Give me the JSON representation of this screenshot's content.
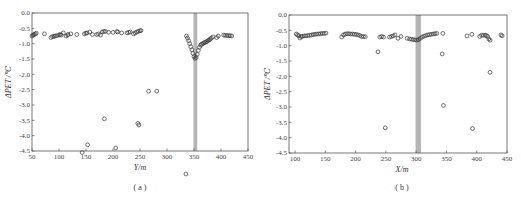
{
  "chart_data": [
    {
      "type": "scatter",
      "panel": "a",
      "caption": "( a )",
      "xlabel": "Y/m",
      "ylabel": "ΔPET /℃",
      "xlim": [
        50,
        450
      ],
      "ylim": [
        -4.5,
        0.0
      ],
      "xticks": [
        50,
        100,
        150,
        200,
        250,
        300,
        350,
        400,
        450
      ],
      "yticks": [
        0.0,
        -0.5,
        -1.0,
        -1.5,
        -2.0,
        -2.5,
        -3.0,
        -3.5,
        -4.0,
        -4.5
      ],
      "highlight_band": [
        349,
        356
      ],
      "grid": false,
      "marker": "open-circle",
      "series": [
        {
          "name": "ΔPET",
          "points": [
            [
              50,
              -0.75
            ],
            [
              52,
              -0.72
            ],
            [
              54,
              -0.7
            ],
            [
              56,
              -0.68
            ],
            [
              58,
              -0.66
            ],
            [
              73,
              -0.68
            ],
            [
              85,
              -0.8
            ],
            [
              88,
              -0.77
            ],
            [
              91,
              -0.76
            ],
            [
              93,
              -0.75
            ],
            [
              96,
              -0.74
            ],
            [
              100,
              -0.72
            ],
            [
              102,
              -0.7
            ],
            [
              104,
              -0.72
            ],
            [
              108,
              -0.65
            ],
            [
              113,
              -0.75
            ],
            [
              116,
              -0.72
            ],
            [
              117,
              -0.7
            ],
            [
              122,
              -0.68
            ],
            [
              133,
              -0.7
            ],
            [
              147,
              -0.68
            ],
            [
              150,
              -0.66
            ],
            [
              152,
              -0.65
            ],
            [
              157,
              -0.62
            ],
            [
              162,
              -0.7
            ],
            [
              170,
              -0.7
            ],
            [
              173,
              -0.68
            ],
            [
              177,
              -0.72
            ],
            [
              180,
              -0.62
            ],
            [
              183,
              -0.6
            ],
            [
              186,
              -0.6
            ],
            [
              192,
              -0.63
            ],
            [
              200,
              -0.63
            ],
            [
              207,
              -0.6
            ],
            [
              209,
              -0.62
            ],
            [
              216,
              -0.65
            ],
            [
              226,
              -0.65
            ],
            [
              229,
              -0.63
            ],
            [
              232,
              -0.62
            ],
            [
              238,
              -0.68
            ],
            [
              241,
              -0.65
            ],
            [
              244,
              -0.62
            ],
            [
              247,
              -0.6
            ],
            [
              250,
              -0.58
            ],
            [
              252,
              -0.57
            ],
            [
              336,
              -0.75
            ],
            [
              338,
              -0.82
            ],
            [
              340,
              -0.9
            ],
            [
              342,
              -1.0
            ],
            [
              344,
              -1.1
            ],
            [
              346,
              -1.2
            ],
            [
              348,
              -1.32
            ],
            [
              350,
              -1.42
            ],
            [
              352,
              -1.48
            ],
            [
              354,
              -1.45
            ],
            [
              356,
              -1.35
            ],
            [
              358,
              -1.22
            ],
            [
              360,
              -1.12
            ],
            [
              362,
              -1.05
            ],
            [
              364,
              -1.02
            ],
            [
              366,
              -1.0
            ],
            [
              368,
              -0.98
            ],
            [
              370,
              -0.96
            ],
            [
              372,
              -0.95
            ],
            [
              374,
              -0.93
            ],
            [
              376,
              -0.9
            ],
            [
              378,
              -0.88
            ],
            [
              380,
              -0.85
            ],
            [
              382,
              -0.82
            ],
            [
              385,
              -0.78
            ],
            [
              392,
              -0.8
            ],
            [
              395,
              -0.75
            ],
            [
              405,
              -0.72
            ],
            [
              408,
              -0.73
            ],
            [
              411,
              -0.73
            ],
            [
              414,
              -0.74
            ],
            [
              417,
              -0.74
            ],
            [
              420,
              -0.75
            ],
            [
              266,
              -2.55
            ],
            [
              281,
              -2.55
            ],
            [
              184,
              -3.45
            ],
            [
              246,
              -3.6
            ],
            [
              248,
              -3.65
            ],
            [
              153,
              -4.3
            ],
            [
              205,
              -4.4
            ],
            [
              143,
              -4.55
            ],
            [
              335,
              -5.25
            ]
          ]
        }
      ]
    },
    {
      "type": "scatter",
      "panel": "b",
      "caption": "( b )",
      "xlabel": "X/m",
      "ylabel": "ΔPET /℃",
      "xlim": [
        90,
        450
      ],
      "ylim": [
        -4.5,
        0.0
      ],
      "xticks": [
        100,
        150,
        200,
        250,
        300,
        350,
        400,
        450
      ],
      "yticks": [
        0.0,
        -0.5,
        -1.0,
        -1.5,
        -2.0,
        -2.5,
        -3.0,
        -3.5,
        -4.0,
        -4.5
      ],
      "highlight_band": [
        299,
        308
      ],
      "grid": false,
      "marker": "open-circle",
      "series": [
        {
          "name": "ΔPET",
          "points": [
            [
              102,
              -0.62
            ],
            [
              104,
              -0.65
            ],
            [
              106,
              -0.68
            ],
            [
              108,
              -0.75
            ],
            [
              110,
              -0.7
            ],
            [
              112,
              -0.7
            ],
            [
              115,
              -0.68
            ],
            [
              118,
              -0.68
            ],
            [
              121,
              -0.67
            ],
            [
              124,
              -0.66
            ],
            [
              127,
              -0.65
            ],
            [
              130,
              -0.64
            ],
            [
              133,
              -0.63
            ],
            [
              136,
              -0.62
            ],
            [
              139,
              -0.62
            ],
            [
              142,
              -0.61
            ],
            [
              145,
              -0.6
            ],
            [
              148,
              -0.6
            ],
            [
              151,
              -0.59
            ],
            [
              177,
              -0.72
            ],
            [
              180,
              -0.65
            ],
            [
              183,
              -0.62
            ],
            [
              186,
              -0.61
            ],
            [
              189,
              -0.61
            ],
            [
              192,
              -0.62
            ],
            [
              195,
              -0.62
            ],
            [
              198,
              -0.63
            ],
            [
              201,
              -0.63
            ],
            [
              204,
              -0.65
            ],
            [
              207,
              -0.67
            ],
            [
              210,
              -0.7
            ],
            [
              213,
              -0.7
            ],
            [
              216,
              -0.71
            ],
            [
              240,
              -0.72
            ],
            [
              243,
              -0.7
            ],
            [
              246,
              -0.72
            ],
            [
              256,
              -0.72
            ],
            [
              259,
              -0.7
            ],
            [
              262,
              -0.68
            ],
            [
              265,
              -0.65
            ],
            [
              270,
              -0.76
            ],
            [
              275,
              -0.7
            ],
            [
              285,
              -0.76
            ],
            [
              289,
              -0.78
            ],
            [
              292,
              -0.79
            ],
            [
              295,
              -0.8
            ],
            [
              298,
              -0.81
            ],
            [
              301,
              -0.82
            ],
            [
              304,
              -0.8
            ],
            [
              307,
              -0.76
            ],
            [
              310,
              -0.72
            ],
            [
              313,
              -0.69
            ],
            [
              316,
              -0.67
            ],
            [
              319,
              -0.65
            ],
            [
              322,
              -0.64
            ],
            [
              325,
              -0.63
            ],
            [
              328,
              -0.62
            ],
            [
              331,
              -0.61
            ],
            [
              334,
              -0.6
            ],
            [
              344,
              -0.6
            ],
            [
              384,
              -0.68
            ],
            [
              392,
              -0.63
            ],
            [
              405,
              -0.7
            ],
            [
              408,
              -0.66
            ],
            [
              411,
              -0.66
            ],
            [
              414,
              -0.66
            ],
            [
              416,
              -0.67
            ],
            [
              418,
              -0.7
            ],
            [
              420,
              -0.78
            ],
            [
              422,
              -0.82
            ],
            [
              440,
              -0.65
            ],
            [
              442,
              -0.68
            ],
            [
              237,
              -1.2
            ],
            [
              343,
              -1.27
            ],
            [
              422,
              -1.87
            ],
            [
              345,
              -2.95
            ],
            [
              249,
              -3.68
            ],
            [
              393,
              -3.7
            ]
          ]
        }
      ]
    }
  ],
  "panels": {
    "a": {
      "caption": "( a )",
      "xlabel": "Y/m",
      "ylabel": "ΔPET /℃"
    },
    "b": {
      "caption": "( b )",
      "xlabel": "X/m",
      "ylabel": "ΔPET /℃"
    }
  }
}
